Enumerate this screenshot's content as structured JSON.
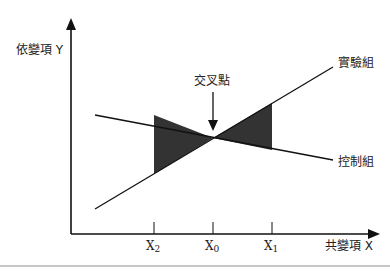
{
  "diagram": {
    "y_axis_label": "依變項 Y",
    "x_axis_label": "共變項 X",
    "intersection_label": "交叉點",
    "lines": [
      {
        "name": "實驗組",
        "label": "實驗組"
      },
      {
        "name": "控制組",
        "label": "控制組"
      }
    ],
    "ticks": [
      {
        "base": "X",
        "sub": "2"
      },
      {
        "base": "X",
        "sub": "0"
      },
      {
        "base": "X",
        "sub": "1"
      }
    ],
    "colors": {
      "line": "#111111",
      "shade": "#333333",
      "background": "#ffffff"
    }
  }
}
